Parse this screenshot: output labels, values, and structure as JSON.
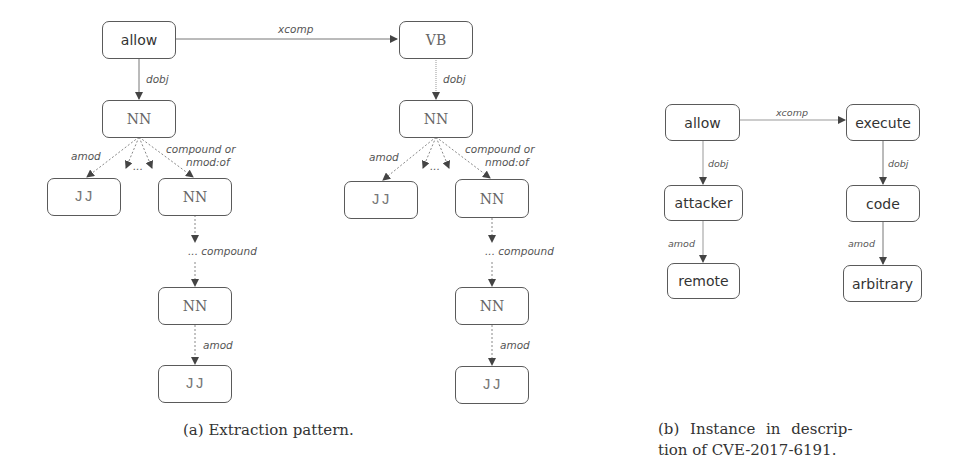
{
  "figure": {
    "subfigure_a": {
      "caption": "(a) Extraction pattern.",
      "left_tree": {
        "root": "allow",
        "child": "NN",
        "jj": "JJ",
        "nn_mid": "NN",
        "nn_low": "NN",
        "jj_low": "JJ"
      },
      "right_tree": {
        "root": "VB",
        "child": "NN",
        "jj": "JJ",
        "nn_mid": "NN",
        "nn_low": "NN",
        "jj_low": "JJ"
      },
      "edges": {
        "xcomp": "xcomp",
        "dobj_left": "dobj",
        "dobj_right": "dobj",
        "amod_left": "amod",
        "amod_right": "amod",
        "ellipsis_left": "...",
        "ellipsis_right": "...",
        "compound_or_left_1": "compound or",
        "compound_or_left_2": "nmod:of",
        "compound_or_right_1": "compound or",
        "compound_or_right_2": "nmod:of",
        "compound_left": "... compound",
        "compound_right": "... compound",
        "amod_low_left": "amod",
        "amod_low_right": "amod"
      }
    },
    "subfigure_b": {
      "caption_line1": "(b) Instance in descrip-",
      "caption_line2": "tion of CVE-2017-6191.",
      "nodes": {
        "allow": "allow",
        "attacker": "attacker",
        "remote": "remote",
        "execute": "execute",
        "code": "code",
        "arbitrary": "arbitrary"
      },
      "edges": {
        "xcomp": "xcomp",
        "dobj_left": "dobj",
        "amod_left": "amod",
        "dobj_right": "dobj",
        "amod_right": "amod"
      }
    }
  }
}
